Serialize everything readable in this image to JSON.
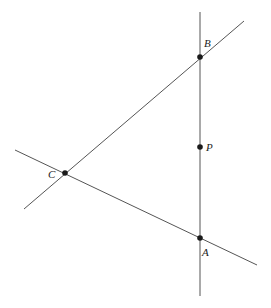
{
  "diagram": {
    "type": "geometry",
    "points": [
      {
        "name": "B",
        "label": "B",
        "x": 200,
        "y": 57,
        "label_x": 204,
        "label_y": 47
      },
      {
        "name": "P",
        "label": "P",
        "x": 200,
        "y": 147,
        "label_x": 206,
        "label_y": 151
      },
      {
        "name": "C",
        "label": "C",
        "x": 65,
        "y": 173,
        "label_x": 48,
        "label_y": 178
      },
      {
        "name": "A",
        "label": "A",
        "x": 200,
        "y": 238,
        "label_x": 202,
        "label_y": 256
      }
    ],
    "lines": [
      {
        "name": "line-AB",
        "x1": 200,
        "y1": 12,
        "x2": 200,
        "y2": 296,
        "through": [
          "B",
          "P",
          "A"
        ]
      },
      {
        "name": "line-BC",
        "x1": 24,
        "y1": 209,
        "x2": 244,
        "y2": 21,
        "through": [
          "C",
          "B"
        ]
      },
      {
        "name": "line-CA",
        "x1": 15,
        "y1": 150,
        "x2": 257,
        "y2": 265,
        "through": [
          "C",
          "A"
        ]
      }
    ],
    "colors": {
      "line": "#555555",
      "point": "#1a1a1a",
      "label": "#222222",
      "background": "#ffffff"
    }
  }
}
